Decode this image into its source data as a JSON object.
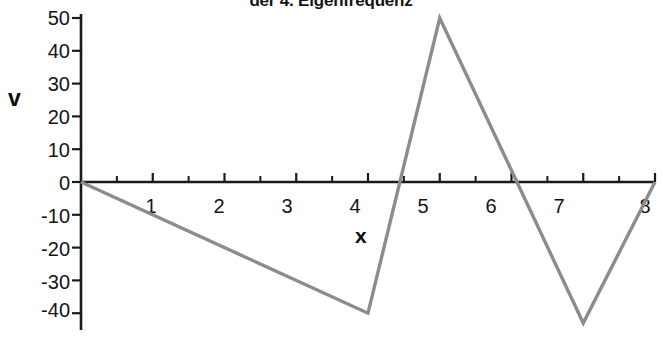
{
  "chart_data": {
    "type": "line",
    "title": "der 4. Eigenfrequenz",
    "xlabel": "x",
    "ylabel": "v",
    "grid": false,
    "legend": null,
    "line_color": "#8c8c8c",
    "axis_color": "#1a1a1a",
    "background": "#ffffff",
    "xlim": [
      0,
      8
    ],
    "ylim": [
      -45,
      52
    ],
    "x_ticks": [
      1,
      2,
      3,
      4,
      5,
      6,
      7,
      8
    ],
    "x_tick_labels": [
      "1",
      "2",
      "3",
      "4",
      "5",
      "6",
      "7",
      "8"
    ],
    "x_minor_ticks": [
      0.5,
      1.5,
      2.5,
      3.5,
      4.5,
      5.5,
      6.5,
      7.5
    ],
    "y_ticks": [
      50,
      40,
      30,
      20,
      10,
      0,
      -10,
      -20,
      -30,
      -40
    ],
    "y_tick_labels": [
      "50",
      "40",
      "30",
      "20",
      "10",
      "0",
      "-10",
      "-20",
      "-30",
      "-40"
    ],
    "x": [
      0,
      4,
      5,
      7,
      8
    ],
    "values": [
      0,
      -40,
      50,
      -43,
      0
    ],
    "points": [
      {
        "x": 0,
        "y": 0
      },
      {
        "x": 4,
        "y": -40
      },
      {
        "x": 5,
        "y": 50
      },
      {
        "x": 7,
        "y": -43
      },
      {
        "x": 8,
        "y": 0
      }
    ],
    "zero_crossings": [
      0,
      4.31,
      6.05,
      8
    ]
  }
}
